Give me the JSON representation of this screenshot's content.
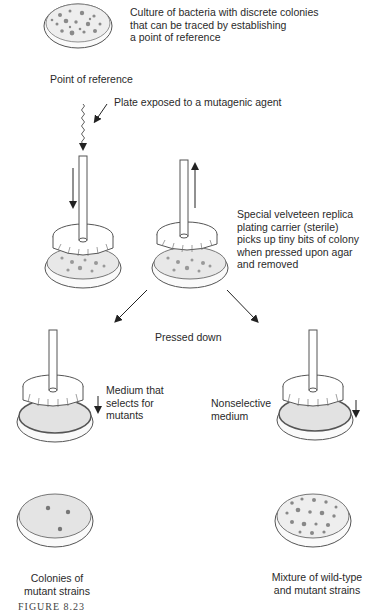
{
  "diagram": {
    "labels": {
      "culture": [
        "Culture of bacteria with discrete colonies",
        "that can be traced by establishing",
        "a point of reference"
      ],
      "point_of_reference": "Point of reference",
      "mutagen": "Plate exposed to a mutagenic agent",
      "velveteen": [
        "Special velveteen replica",
        "plating carrier (sterile)",
        "picks up tiny bits of colony",
        "when pressed upon agar",
        "and removed"
      ],
      "pressed_down": "Pressed down",
      "selective": [
        "Medium that",
        "selects for",
        "mutants"
      ],
      "nonselective": [
        "Nonselective",
        "medium"
      ],
      "mutant_colonies": [
        "Colonies of",
        "mutant strains"
      ],
      "mixture": [
        "Mixture of wild-type",
        "and mutant strains"
      ]
    },
    "caption": "FIGURE 8.23",
    "colors": {
      "line": "#333333",
      "colony": "#8a8a8a",
      "agar": "#e6e6e6",
      "dish_fill": "#f7f7f7"
    }
  }
}
